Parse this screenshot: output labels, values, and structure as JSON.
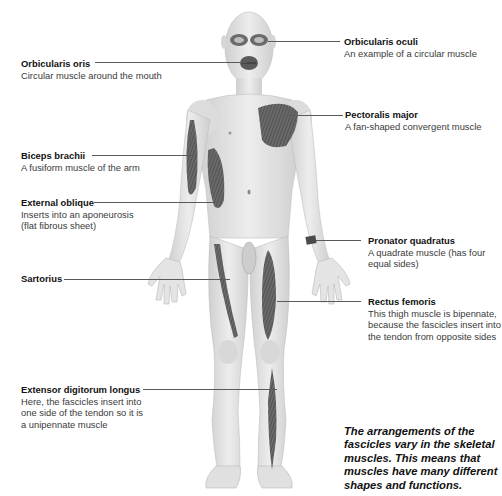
{
  "diagram": {
    "labels": [
      {
        "id": "orbicularis-oris",
        "title": "Orbicularis oris",
        "description": "Circular muscle around the mouth",
        "side": "left"
      },
      {
        "id": "orbicularis-oculi",
        "title": "Orbicularis oculi",
        "description": "An example of a circular muscle",
        "side": "right"
      },
      {
        "id": "pectoralis-major",
        "title": "Pectoralis major",
        "description": "A fan-shaped convergent muscle",
        "side": "right"
      },
      {
        "id": "biceps-brachii",
        "title": "Biceps brachii",
        "description": "A fusiform muscle of the arm",
        "side": "left"
      },
      {
        "id": "external-oblique",
        "title": "External oblique",
        "description_lines": [
          "Inserts into an aponeurosis",
          "(flat fibrous sheet)"
        ],
        "side": "left"
      },
      {
        "id": "pronator-quadratus",
        "title": "Pronator quadratus",
        "description_lines": [
          "A quadrate muscle (has four",
          "equal sides)"
        ],
        "side": "right"
      },
      {
        "id": "sartorius",
        "title": "Sartorius",
        "description": "",
        "side": "left"
      },
      {
        "id": "rectus-femoris",
        "title": "Rectus femoris",
        "description_lines": [
          "This thigh muscle is bipennate,",
          "because the fascicles insert into",
          "the tendon from opposite sides"
        ],
        "side": "right"
      },
      {
        "id": "extensor-digitorum-longus",
        "title": "Extensor digitorum longus",
        "description_lines": [
          "Here, the fascicles insert into",
          "one side of the tendon so it is",
          "a unipennate muscle"
        ],
        "side": "left"
      }
    ],
    "note_lines": [
      "The arrangements of the",
      "fascicles vary in the skeletal",
      "muscles. This means that",
      "muscles have many different",
      "shapes and functions."
    ],
    "colors": {
      "skin": "#e6e6e6",
      "skin_shadow": "#c4c4c4",
      "muscle": "#6a6a6a",
      "muscle_dark": "#3f3f3f",
      "leader_line": "#5a5a5a",
      "text": "#2a2a2a"
    }
  }
}
